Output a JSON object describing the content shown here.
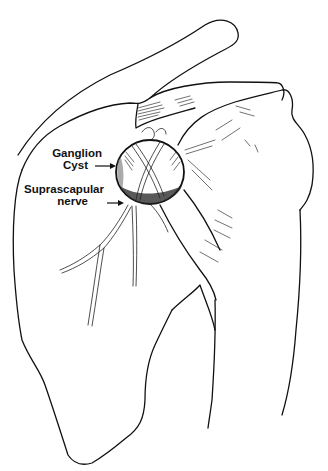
{
  "figure": {
    "type": "anatomical-illustration",
    "line_color": "#111111",
    "background": "#ffffff"
  },
  "labels": {
    "ganglion_cyst": {
      "line1": "Ganglion",
      "line2": "Cyst"
    },
    "suprascapular_nerve": {
      "line1": "Suprascapular",
      "line2": "nerve"
    }
  }
}
